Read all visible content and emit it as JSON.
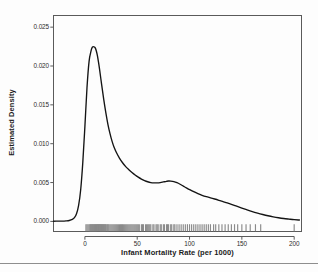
{
  "figure": {
    "background": "#fdfdfd",
    "frame_color": "#5a5a5a",
    "curve_color": "#141414",
    "rug_color": "#8a8a8a",
    "axis_text_color": "#2a2a2a",
    "label_text_color": "#1b1b1b"
  },
  "chart_data": {
    "type": "line",
    "subtype": "kernel-density-estimate-with-rug",
    "title": "",
    "xlabel": "Infant Mortality Rate (per 1000)",
    "ylabel": "Estimated Density",
    "grid": false,
    "legend": null,
    "xlim": [
      -30,
      207
    ],
    "ylim": [
      -0.0013,
      0.0265
    ],
    "xticks": [
      0,
      50,
      100,
      150,
      200
    ],
    "xticklabels": [
      "0",
      "50",
      "100",
      "150",
      "200"
    ],
    "yticks": [
      0.0,
      0.005,
      0.01,
      0.015,
      0.02,
      0.025
    ],
    "yticklabels": [
      "0.000",
      "0.005",
      "0.010",
      "0.015",
      "0.020",
      "0.025"
    ],
    "series": [
      {
        "name": "Estimated Density",
        "x": [
          -30,
          -26,
          -22,
          -18,
          -15,
          -12,
          -10,
          -8,
          -6,
          -4,
          -2,
          0,
          2,
          4,
          6,
          7,
          8,
          9,
          10,
          11,
          12,
          13,
          14,
          16,
          18,
          20,
          22,
          24,
          26,
          28,
          30,
          33,
          36,
          39,
          42,
          45,
          48,
          51,
          54,
          57,
          60,
          63,
          66,
          69,
          72,
          75,
          78,
          80,
          82,
          85,
          88,
          91,
          94,
          97,
          100,
          104,
          108,
          112,
          116,
          120,
          124,
          128,
          132,
          136,
          140,
          145,
          150,
          155,
          160,
          165,
          170,
          175,
          180,
          185,
          190,
          195,
          200,
          205
        ],
        "y": [
          2e-05,
          3e-05,
          4e-05,
          7e-05,
          0.00012,
          0.00026,
          0.00048,
          0.00098,
          0.00205,
          0.0041,
          0.0076,
          0.0122,
          0.0172,
          0.0206,
          0.022,
          0.0224,
          0.0225,
          0.02245,
          0.0223,
          0.0219,
          0.0213,
          0.0205,
          0.0196,
          0.0176,
          0.0157,
          0.014,
          0.0125,
          0.0113,
          0.0103,
          0.0095,
          0.0089,
          0.00815,
          0.00755,
          0.00705,
          0.00665,
          0.0063,
          0.00598,
          0.0057,
          0.00545,
          0.00525,
          0.0051,
          0.005,
          0.00496,
          0.00496,
          0.005,
          0.00508,
          0.00516,
          0.0052,
          0.00519,
          0.00512,
          0.00498,
          0.00478,
          0.00455,
          0.00432,
          0.0041,
          0.00382,
          0.00357,
          0.00336,
          0.00318,
          0.00303,
          0.00288,
          0.00272,
          0.00255,
          0.00238,
          0.0022,
          0.00196,
          0.00172,
          0.00149,
          0.00127,
          0.00107,
          0.00089,
          0.00073,
          0.00059,
          0.00047,
          0.00037,
          0.00029,
          0.00022,
          0.00018
        ]
      }
    ],
    "rug": {
      "label": "observations",
      "values": [
        1,
        2,
        3,
        4,
        5,
        5,
        6,
        6,
        7,
        7,
        8,
        8,
        9,
        9,
        10,
        10,
        11,
        11,
        12,
        12,
        13,
        13,
        14,
        14,
        15,
        15,
        16,
        16,
        17,
        17,
        18,
        18,
        19,
        19,
        20,
        20,
        21,
        22,
        22,
        23,
        24,
        25,
        26,
        27,
        28,
        29,
        30,
        31,
        32,
        33,
        34,
        35,
        36,
        37,
        38,
        39,
        40,
        41,
        42,
        43,
        44,
        45,
        46,
        47,
        48,
        49,
        50,
        51,
        52,
        54,
        55,
        56,
        58,
        59,
        60,
        61,
        62,
        63,
        65,
        66,
        68,
        69,
        70,
        72,
        73,
        75,
        76,
        78,
        79,
        80,
        82,
        83,
        85,
        86,
        88,
        90,
        92,
        94,
        96,
        98,
        100,
        102,
        104,
        106,
        108,
        110,
        112,
        114,
        116,
        118,
        120,
        123,
        125,
        128,
        131,
        134,
        137,
        140,
        143,
        146,
        150,
        154,
        158,
        163,
        168,
        200
      ]
    }
  },
  "axis_titles": {
    "x": "Infant Mortality Rate (per 1000)",
    "y": "Estimated Density"
  }
}
